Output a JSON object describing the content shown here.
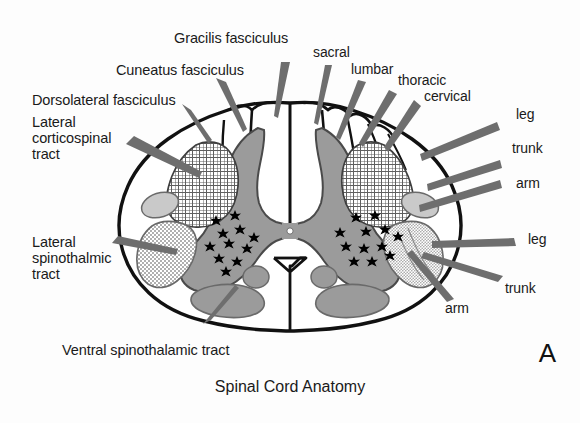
{
  "figure": {
    "title": "Spinal Cord Anatomy",
    "panel_letter": "A"
  },
  "colors": {
    "outline": "#111111",
    "gray_matter": "#9b9b9b",
    "gray_matter_edge": "#4a4a4a",
    "light_tract": "#c9c9c9",
    "stipple_tract": "#cfcfcf",
    "crosshatch_line": "#5a5a5a",
    "pointer": "#6e6e6e",
    "background": "#fdfdfd",
    "text": "#1a1a1a",
    "motor_neuron_star": "#000000"
  },
  "labels": {
    "gracilis_fasciculus": "Gracilis fasciculus",
    "cuneatus_fasciculus": "Cuneatus fasciculus",
    "dorsolateral_fasciculus": "Dorsolateral fasciculus",
    "lateral_corticospinal_tract": "Lateral corticospinal tract",
    "lateral_spinothalmic_tract": "Lateral spinothalmic tract",
    "ventral_spinothalamic_tract": "Ventral spinothalamic tract",
    "sacral": "sacral",
    "lumbar": "lumbar",
    "thoracic": "thoracic",
    "cervical": "cervical",
    "corticospinal_leg": "leg",
    "corticospinal_trunk": "trunk",
    "corticospinal_arm": "arm",
    "spinothalamic_leg": "leg",
    "spinothalamic_trunk": "trunk",
    "spinothalamic_arm": "arm"
  },
  "label_lines": {
    "lateral_corticospinal_tract": [
      "Lateral",
      "corticospinal",
      "tract"
    ],
    "lateral_spinothalmic_tract": [
      "Lateral",
      "spinothalmic",
      "tract"
    ]
  },
  "annotations": {
    "dorsal_column_somatotopy": [
      "sacral",
      "lumbar",
      "thoracic",
      "cervical"
    ],
    "corticospinal_somatotopy": [
      "leg",
      "trunk",
      "arm"
    ],
    "spinothalamic_somatotopy": [
      "leg",
      "trunk",
      "arm"
    ],
    "motor_neuron_marker": "star",
    "motor_neuron_count_left": 11,
    "motor_neuron_count_right": 12,
    "central_canal": "white-dot"
  }
}
